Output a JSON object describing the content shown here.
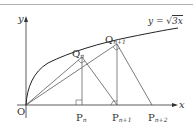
{
  "diagram": {
    "type": "geometry",
    "colors": {
      "line": "#333333",
      "vertical": "#555555",
      "top_rule": "#b0b0b0",
      "background": "#ffffff"
    },
    "axes": {
      "x_label": "x",
      "y_label": "y",
      "origin_label": "O"
    },
    "curve": {
      "equation_prefix": "y = ",
      "sqrt_content": "3x",
      "label_full": "y=√3x"
    },
    "points": {
      "Qn": {
        "main": "Q",
        "sub": "n"
      },
      "Qn1": {
        "main": "Q",
        "sub": "n+1"
      },
      "Pn": {
        "main": "P",
        "sub": "n"
      },
      "Pn1": {
        "main": "P",
        "sub": "n+1"
      },
      "Pn2": {
        "main": "P",
        "sub": "n+2"
      }
    }
  }
}
